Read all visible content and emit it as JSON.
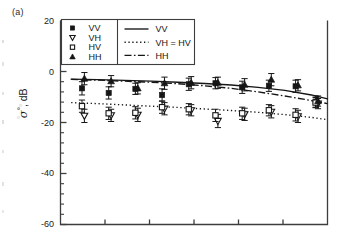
{
  "figure": {
    "panel_label": "(a)",
    "y_axis_title_symbol": "σ",
    "y_axis_title_degree": "°",
    "y_axis_title_unit": ", dB"
  },
  "axes": {
    "y_ticks": [
      "20",
      "0",
      "-20",
      "-40",
      "-60"
    ],
    "y_tick_values": [
      20,
      0,
      -20,
      -40,
      -60
    ],
    "y_minor_per_interval": 4,
    "x_tick_count": 6,
    "x_tick_labels": []
  },
  "legend": {
    "markers": [
      {
        "label": "VV",
        "symbol": "filled-square"
      },
      {
        "label": "VH",
        "symbol": "open-triangle-down"
      },
      {
        "label": "HV",
        "symbol": "open-square"
      },
      {
        "label": "HH",
        "symbol": "filled-triangle-up"
      }
    ],
    "lines": [
      {
        "label": "VV",
        "style": "solid"
      },
      {
        "label": "VH = HV",
        "style": "dotted"
      },
      {
        "label": "HH",
        "style": "dash-dot"
      }
    ]
  },
  "chart_data": {
    "type": "scatter",
    "title": "",
    "xlabel": "",
    "ylabel": "σ°, dB",
    "ylim": [
      -60,
      20
    ],
    "xlim": [
      0,
      10
    ],
    "grid": false,
    "legend_position": "top-left",
    "x": [
      0.85,
      1.85,
      2.85,
      3.85,
      4.85,
      5.85,
      6.85,
      7.85,
      8.85,
      9.6
    ],
    "series": [
      {
        "name": "VV",
        "marker": "filled-square",
        "kind": "points-with-errorbars",
        "values": [
          -6.6,
          -8.4,
          -6.8,
          -9.2,
          -5.0,
          -4.6,
          -6.2,
          -5.6,
          -5.8,
          -11.8
        ],
        "error": [
          2.6,
          2.4,
          2.2,
          2.4,
          2.4,
          2.2,
          2.4,
          2.2,
          2.4,
          2.2
        ]
      },
      {
        "name": "VH",
        "marker": "open-triangle-down",
        "kind": "points-with-errorbars",
        "values": [
          -17.4,
          -17.2,
          -17.0,
          -14.6,
          -15.2,
          -19.4,
          -16.8,
          -15.8,
          -17.6,
          -12.6
        ],
        "error": [
          2.6,
          2.4,
          2.6,
          2.4,
          2.2,
          2.6,
          2.4,
          2.4,
          2.4,
          2.0
        ]
      },
      {
        "name": "HV",
        "marker": "open-square",
        "kind": "points-with-errorbars",
        "values": [
          -13.6,
          -16.4,
          -16.2,
          -14.0,
          -14.8,
          -17.2,
          -16.4,
          -15.2,
          -17.0,
          -12.2
        ],
        "error": [
          2.4,
          2.4,
          2.4,
          2.4,
          2.2,
          2.4,
          2.4,
          2.2,
          2.4,
          2.0
        ]
      },
      {
        "name": "HH",
        "marker": "filled-triangle-up",
        "kind": "points-with-errorbars",
        "values": [
          -2.8,
          -3.8,
          -6.6,
          -4.6,
          -4.4,
          -4.4,
          -5.2,
          -3.2,
          -5.4,
          -11.6
        ],
        "error": [
          2.4,
          2.2,
          2.2,
          2.4,
          2.4,
          2.2,
          2.4,
          2.4,
          2.2,
          2.0
        ]
      }
    ],
    "model_curves": [
      {
        "name": "VV",
        "style": "solid",
        "x": [
          0.4,
          1.4,
          2.4,
          3.4,
          4.4,
          5.4,
          6.4,
          7.4,
          8.4,
          9.4,
          10.0
        ],
        "values": [
          -3.0,
          -3.2,
          -3.5,
          -3.8,
          -4.2,
          -4.7,
          -5.3,
          -6.2,
          -7.4,
          -9.2,
          -10.7
        ]
      },
      {
        "name": "VH = HV",
        "style": "dotted",
        "x": [
          0.4,
          1.4,
          2.4,
          3.4,
          4.4,
          5.4,
          6.4,
          7.4,
          8.4,
          9.4,
          10.0
        ],
        "values": [
          -12.2,
          -12.6,
          -13.1,
          -13.6,
          -14.1,
          -14.7,
          -15.3,
          -16.0,
          -16.9,
          -18.0,
          -18.9
        ]
      },
      {
        "name": "HH",
        "style": "dash-dot",
        "x": [
          0.4,
          1.4,
          2.4,
          3.4,
          4.4,
          5.4,
          6.4,
          7.4,
          8.4,
          9.4,
          10.0
        ],
        "values": [
          -3.1,
          -3.4,
          -3.8,
          -4.2,
          -4.8,
          -5.6,
          -6.6,
          -8.0,
          -9.6,
          -11.4,
          -12.6
        ]
      }
    ]
  },
  "colors": {
    "ink": "#161616",
    "axis": "#3d3d3d",
    "background": "#ffffff"
  }
}
